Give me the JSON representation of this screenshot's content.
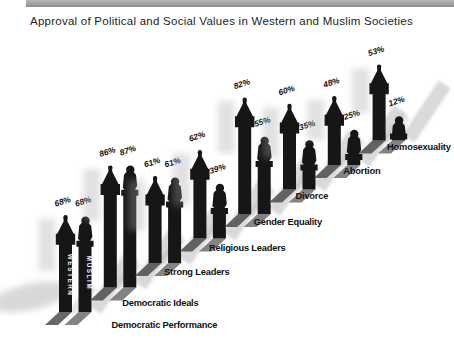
{
  "header": {
    "title": "Approval of Political and Social Values in Western and Muslim Societies"
  },
  "chart_data": {
    "type": "bar",
    "title": "Approval of Political and Social Values in Western and Muslim Societies",
    "subtitle": "",
    "unit": "%",
    "ylim": [
      0,
      100
    ],
    "grid": false,
    "legend_position": "labels-on-first-bar-pair",
    "bar_style": "pictorial black silhouettes: Western = steeple tower, Muslim = statue figure on column",
    "bar_color": "#161616",
    "shadow_color": "#a5a5a5",
    "categories": [
      "Democratic Performance",
      "Democratic Ideals",
      "Strong Leaders",
      "Religious Leaders",
      "Gender Equality",
      "Divorce",
      "Abortion",
      "Homosexuality"
    ],
    "series": [
      {
        "name": "WESTERN",
        "values": [
          68,
          86,
          61,
          62,
          82,
          60,
          48,
          53
        ]
      },
      {
        "name": "MUSLIM",
        "values": [
          68,
          87,
          61,
          39,
          55,
          35,
          25,
          12
        ]
      }
    ],
    "value_labels": {
      "WESTERN": [
        "68%",
        "86%",
        "61%",
        "62%",
        "82%",
        "60%",
        "48%",
        "53%"
      ],
      "MUSLIM": [
        "68%",
        "87%",
        "61%",
        "39%",
        "55%",
        "35%",
        "25%",
        "12%"
      ]
    }
  }
}
